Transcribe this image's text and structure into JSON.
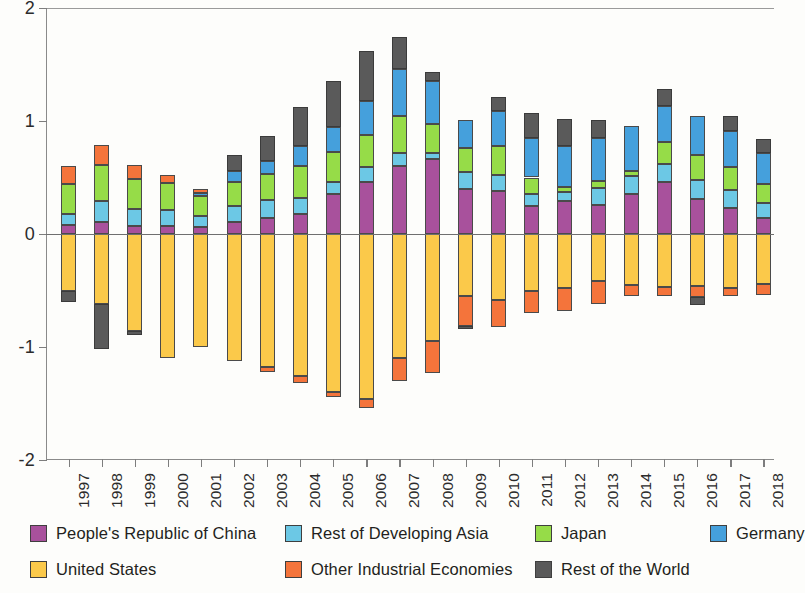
{
  "chart_data": {
    "type": "bar",
    "stacked": true,
    "title": "",
    "subtitle": "",
    "xlabel": "",
    "ylabel": "",
    "ylim": [
      -2,
      2
    ],
    "yticks": [
      2,
      1,
      0,
      -1,
      -2
    ],
    "ytick_labels": [
      "2",
      "1",
      "0",
      "-1",
      "-2"
    ],
    "grid": false,
    "legend_position": "bottom",
    "categories": [
      "1997",
      "1998",
      "1999",
      "2000",
      "2001",
      "2002",
      "2003",
      "2004",
      "2005",
      "2006",
      "2007",
      "2008",
      "2009",
      "2010",
      "2011",
      "2012",
      "2013",
      "2014",
      "2015",
      "2016",
      "2017",
      "2018"
    ],
    "series": [
      {
        "name": "People's Republic of China",
        "color": "#A8519C",
        "values": [
          0.08,
          0.11,
          0.07,
          0.07,
          0.06,
          0.11,
          0.14,
          0.18,
          0.35,
          0.46,
          0.6,
          0.66,
          0.4,
          0.38,
          0.25,
          0.29,
          0.26,
          0.35,
          0.46,
          0.31,
          0.23,
          0.14
        ]
      },
      {
        "name": "Rest of Developing Asia",
        "color": "#6CC8E5",
        "values": [
          0.1,
          0.18,
          0.15,
          0.14,
          0.1,
          0.14,
          0.16,
          0.14,
          0.11,
          0.13,
          0.12,
          0.06,
          0.15,
          0.14,
          0.1,
          0.08,
          0.15,
          0.16,
          0.16,
          0.17,
          0.16,
          0.13
        ]
      },
      {
        "name": "Japan",
        "color": "#96DC48",
        "values": [
          0.26,
          0.32,
          0.27,
          0.24,
          0.18,
          0.21,
          0.23,
          0.28,
          0.27,
          0.29,
          0.32,
          0.25,
          0.21,
          0.26,
          0.15,
          0.05,
          0.06,
          0.05,
          0.19,
          0.22,
          0.2,
          0.17
        ]
      },
      {
        "name": "Germany",
        "color": "#45A0DC",
        "values": [
          0.0,
          0.0,
          0.0,
          0.0,
          0.02,
          0.1,
          0.12,
          0.18,
          0.22,
          0.3,
          0.42,
          0.38,
          0.25,
          0.31,
          0.35,
          0.36,
          0.38,
          0.4,
          0.32,
          0.34,
          0.32,
          0.28
        ]
      },
      {
        "name": "United States",
        "color": "#FBC94A",
        "values": [
          -0.5,
          -0.62,
          -0.86,
          -1.1,
          -1.0,
          -1.12,
          -1.18,
          -1.26,
          -1.4,
          -1.46,
          -1.1,
          -0.95,
          -0.55,
          -0.58,
          -0.5,
          -0.48,
          -0.42,
          -0.45,
          -0.47,
          -0.46,
          -0.48,
          -0.44
        ]
      },
      {
        "name": "Other Industrial Economies",
        "color": "#F4743B",
        "values": [
          0.16,
          0.18,
          0.12,
          0.07,
          0.04,
          0.0,
          -0.04,
          -0.06,
          -0.04,
          -0.08,
          -0.2,
          -0.28,
          -0.26,
          -0.24,
          -0.2,
          -0.2,
          -0.2,
          -0.1,
          -0.08,
          -0.1,
          -0.07,
          -0.1
        ]
      },
      {
        "name": "Rest of the World",
        "color": "#5A5A5A",
        "values": [
          -0.1,
          -0.4,
          -0.03,
          0.0,
          0.0,
          0.14,
          0.22,
          0.34,
          0.4,
          0.44,
          0.28,
          0.08,
          -0.03,
          0.12,
          0.22,
          0.24,
          0.16,
          0.0,
          0.15,
          -0.07,
          0.13,
          0.12
        ]
      }
    ],
    "positive_stack_order": [
      "People's Republic of China",
      "Rest of Developing Asia",
      "Japan",
      "Germany",
      "Other Industrial Economies",
      "Rest of the World"
    ],
    "negative_stack_order": [
      "United States",
      "Other Industrial Economies",
      "Rest of the World"
    ]
  },
  "legend": {
    "items": [
      {
        "label": "People's Republic of China",
        "color": "#A8519C"
      },
      {
        "label": "Rest of Developing Asia",
        "color": "#6CC8E5"
      },
      {
        "label": "Japan",
        "color": "#96DC48"
      },
      {
        "label": "Germany",
        "color": "#45A0DC"
      },
      {
        "label": "United States",
        "color": "#FBC94A"
      },
      {
        "label": "Other Industrial Economies",
        "color": "#F4743B"
      },
      {
        "label": "Rest of the World",
        "color": "#5A5A5A"
      }
    ]
  }
}
